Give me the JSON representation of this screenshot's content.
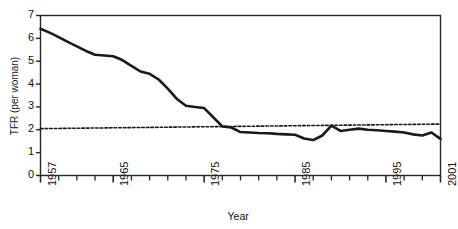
{
  "chart_data": {
    "type": "line",
    "title": "",
    "xlabel": "Year",
    "ylabel": "TFR (per woman)",
    "xlim": [
      1957,
      2001
    ],
    "ylim": [
      0,
      7
    ],
    "yticks": [
      0,
      1,
      2,
      3,
      4,
      5,
      6,
      7
    ],
    "ytick_labels": [
      "0",
      "1",
      "2",
      "3",
      "4",
      "5",
      "6",
      "7"
    ],
    "xticks": [
      1957,
      1965,
      1975,
      1985,
      1995,
      2001
    ],
    "xtick_labels": [
      "1957",
      "1965",
      "1975",
      "1985",
      "1995",
      "2001"
    ],
    "minor_xtick_interval": 2,
    "grid": false,
    "legend": false,
    "frame": "box",
    "series": [
      {
        "name": "TFR (per woman)",
        "style": "solid",
        "color": "#1a1a1a",
        "linewidth": 2.6,
        "x": [
          1957,
          1958,
          1959,
          1960,
          1961,
          1962,
          1963,
          1964,
          1965,
          1966,
          1967,
          1968,
          1969,
          1970,
          1971,
          1972,
          1973,
          1974,
          1975,
          1976,
          1977,
          1978,
          1979,
          1980,
          1981,
          1982,
          1983,
          1984,
          1985,
          1986,
          1987,
          1988,
          1989,
          1990,
          1991,
          1992,
          1993,
          1994,
          1995,
          1996,
          1997,
          1998,
          1999,
          2000,
          2001
        ],
        "values": [
          6.42,
          6.25,
          6.05,
          5.85,
          5.65,
          5.45,
          5.28,
          5.25,
          5.22,
          5.05,
          4.8,
          4.55,
          4.45,
          4.2,
          3.8,
          3.35,
          3.05,
          3.0,
          2.95,
          2.55,
          2.15,
          2.1,
          1.9,
          1.88,
          1.86,
          1.85,
          1.82,
          1.8,
          1.78,
          1.62,
          1.55,
          1.75,
          2.18,
          1.95,
          2.0,
          2.05,
          2.0,
          1.98,
          1.95,
          1.92,
          1.88,
          1.8,
          1.75,
          1.88,
          1.6
        ]
      },
      {
        "name": "Replacement level",
        "style": "dashed",
        "color": "#1a1a1a",
        "linewidth": 1.6,
        "x": [
          1957,
          2001
        ],
        "values": [
          2.05,
          2.25
        ]
      }
    ]
  },
  "axes": {
    "y_title": "TFR (per woman)",
    "x_title": "Year"
  }
}
